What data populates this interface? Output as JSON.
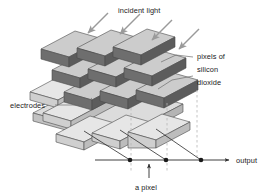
{
  "figure": {
    "background_color": "#ffffff"
  },
  "labels": {
    "incident_light": "incident light",
    "pixels_line1": "pixels of",
    "pixels_line2": "silicon",
    "pixels_line3": "dioxide",
    "electrodes": "electrodes",
    "output": "output",
    "a_pixel": "a pixel"
  },
  "colors": {
    "pixel_top": "#c9c9c9",
    "pixel_side": "#b0b0b0",
    "pixel_front_dark": "#6e6e6e",
    "pixel_front_dark_side": "#5e5e5e",
    "electrode_top": "#e2e2e2",
    "electrode_side": "#c5c5c5",
    "electrode_front": "#b8b8b8",
    "substrate_top": "#d6d6d6",
    "outline": "#4a4a4a",
    "arrow_gray": "#9a9a9a",
    "wire": "#2b2b2b",
    "dashed": "#b5b5b5",
    "text": "#1a1a1a"
  },
  "structure": {
    "pixel_grid_rows": 3,
    "pixel_grid_cols": 3,
    "electrode_bars": 3,
    "incident_light_arrows": 4,
    "output_nodes": 3,
    "dashed_guides": 3
  },
  "geometry": {
    "output_line_y": 160,
    "output_line_x_start": 95,
    "output_line_x_end": 232,
    "node_x_positions": [
      130,
      166,
      201
    ]
  }
}
